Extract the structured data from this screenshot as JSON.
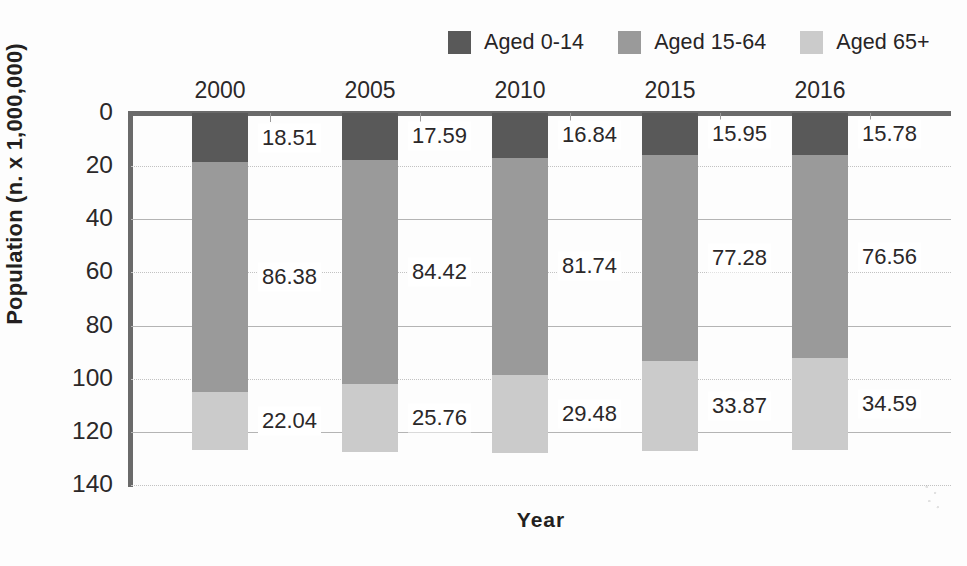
{
  "chart_data": {
    "type": "bar",
    "subtype": "stacked-vertical-inverted-axis",
    "title": "",
    "xlabel": "Year",
    "ylabel": "Population (n. x 1,000,000)",
    "categories": [
      "2000",
      "2005",
      "2010",
      "2015",
      "2016"
    ],
    "series": [
      {
        "name": "Aged 0-14",
        "color": "#595959",
        "values": [
          18.51,
          17.59,
          16.84,
          15.95,
          15.78
        ]
      },
      {
        "name": "Aged 15-64",
        "color": "#9a9a9a",
        "values": [
          86.38,
          84.42,
          81.74,
          77.28,
          76.56
        ]
      },
      {
        "name": "Aged 65+",
        "color": "#cbcbcb",
        "values": [
          22.04,
          25.76,
          29.48,
          33.87,
          34.59
        ]
      }
    ],
    "ylim": [
      0,
      140
    ],
    "y_axis_inverted": true,
    "yticks": [
      0,
      20,
      40,
      60,
      80,
      100,
      120,
      140
    ],
    "ytick_labels": [
      "0",
      "20",
      "40",
      "60",
      "80",
      "100",
      "120",
      "140"
    ],
    "gridlines": {
      "enabled": true,
      "solid_at": [
        40,
        80,
        120
      ],
      "dotted_at": [
        20,
        60,
        100,
        140
      ]
    },
    "legend": {
      "position": "top-right",
      "entries": [
        "Aged 0-14",
        "Aged 15-64",
        "Aged 65+"
      ]
    },
    "value_labels": {
      "shown": true,
      "position": "right-of-bar",
      "text": [
        [
          "18.51",
          "86.38",
          "22.04"
        ],
        [
          "17.59",
          "84.42",
          "25.76"
        ],
        [
          "16.84",
          "81.74",
          "29.48"
        ],
        [
          "15.95",
          "77.28",
          "33.87"
        ],
        [
          "15.78",
          "76.56",
          "34.59"
        ]
      ]
    },
    "x_tick_labels_position": "top"
  },
  "axes": {
    "ylabel": "Population (n. x 1,000,000)",
    "xlabel": "Year",
    "yticks": [
      "0",
      "20",
      "40",
      "60",
      "80",
      "100",
      "120",
      "140"
    ]
  },
  "legend": {
    "items": [
      {
        "label": "Aged 0-14",
        "color": "#595959"
      },
      {
        "label": "Aged 15-64",
        "color": "#9a9a9a"
      },
      {
        "label": "Aged 65+",
        "color": "#cbcbcb"
      }
    ]
  },
  "colors": {
    "aged_0_14": "#595959",
    "aged_15_64": "#9a9a9a",
    "aged_65_plus": "#cbcbcb",
    "axis": "#6a6a6a",
    "text": "#231f20",
    "background": "#fdfdfd"
  }
}
